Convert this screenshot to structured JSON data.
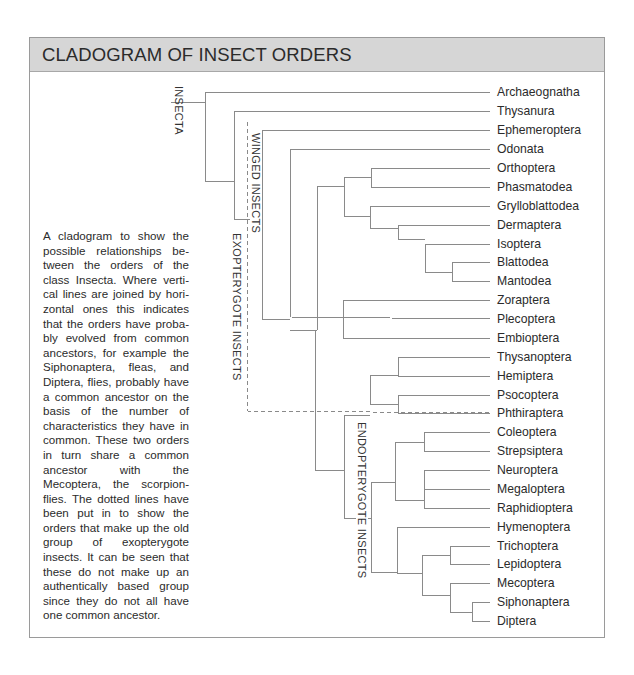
{
  "title": "CLADOGRAM OF INSECT ORDERS",
  "caption": "A cladogram to show the possible relationships be­tween the orders of the class Insecta. Where verti­cal lines are joined by hori­zontal ones this indicates that the orders have proba­bly evolved from common ancestors, for example the Siphonaptera, fleas, and Diptera, flies, probably have a common ancestor on the basis of the number of characteristics they have in common. These two orders in turn share a com­mon ancestor with the Mecoptera, the scorpion­flies. The dotted lines have been put in to show the orders that make up the old group of exopterygote insects. It can be seen that these do not make up an authentically based group since they do not all have one common ancestor.",
  "group_labels": {
    "insecta": "INSECTA",
    "winged": "WINGED INSECTS",
    "exopterygote": "EXOPTERYGOTE INSECTS",
    "endopterygote": "ENDOPTERYGOTE INSECTS"
  },
  "chart_data": {
    "type": "cladogram",
    "title": "CLADOGRAM OF INSECT ORDERS",
    "taxa": [
      "Archaeognatha",
      "Thysanura",
      "Ephemeroptera",
      "Odonata",
      "Orthoptera",
      "Phasmatodea",
      "Grylloblattodea",
      "Dermaptera",
      "Isoptera",
      "Blattodea",
      "Mantodea",
      "Zoraptera",
      "Plecoptera",
      "Embioptera",
      "Thysanoptera",
      "Hemiptera",
      "Psocoptera",
      "Phthiraptera",
      "Coleoptera",
      "Strepsiptera",
      "Neuroptera",
      "Megaloptera",
      "Raphidioptera",
      "Hymenoptera",
      "Trichoptera",
      "Lepidoptera",
      "Mecoptera",
      "Siphonaptera",
      "Diptera"
    ],
    "newick": "(Archaeognatha,(Thysanura,(Ephemeroptera,((Odonata,((Orthoptera,Phasmatodea),(Grylloblattodea,(Dermaptera,(Isoptera,(Blattodea,Mantodea))))),(Zoraptera,Plecoptera,Embioptera)),(((Thysanoptera,Hemiptera),(Psocoptera,Phthiraptera)),(((Coleoptera,Strepsiptera),(Neuroptera,Megaloptera,Raphidioptera)),(Hymenoptera,((Trichoptera,Lepidoptera),(Mecoptera,(Siphonaptera,Diptera))))))))))",
    "groups": [
      {
        "name": "INSECTA",
        "members": "all"
      },
      {
        "name": "WINGED INSECTS",
        "members_from": "Ephemeroptera",
        "members_to": "Diptera"
      },
      {
        "name": "EXOPTERYGOTE INSECTS",
        "style": "dotted",
        "members_from": "Ephemeroptera",
        "members_to": "Phthiraptera"
      },
      {
        "name": "ENDOPTERYGOTE INSECTS",
        "members_from": "Coleoptera",
        "members_to": "Diptera"
      }
    ],
    "row_y": [
      92,
      111,
      130,
      149,
      168,
      187,
      206,
      225,
      244,
      262,
      281,
      300,
      319,
      338,
      357,
      376,
      395,
      413,
      432,
      451,
      470,
      489,
      508,
      527,
      546,
      564,
      583,
      602,
      621
    ],
    "label_x": 497,
    "tip_x": 490,
    "segments": [
      [
        171,
        102,
        205,
        102
      ],
      [
        205,
        92,
        205,
        181
      ],
      [
        205,
        92,
        490,
        92
      ],
      [
        205,
        181,
        234,
        181
      ],
      [
        234,
        111,
        234,
        219
      ],
      [
        234,
        111,
        490,
        111
      ],
      [
        234,
        219,
        262,
        219
      ],
      [
        262,
        130,
        262,
        319
      ],
      [
        262,
        130,
        490,
        130
      ],
      [
        262,
        319,
        290,
        319
      ],
      [
        290,
        149,
        290,
        317
      ],
      [
        290,
        149,
        490,
        149
      ],
      [
        290,
        317,
        490,
        319
      ],
      [
        317,
        186,
        317,
        330
      ],
      [
        317,
        330,
        290,
        330
      ],
      [
        317,
        186,
        344,
        186
      ],
      [
        344,
        177,
        344,
        216
      ],
      [
        344,
        177,
        371,
        177
      ],
      [
        371,
        168,
        371,
        187
      ],
      [
        371,
        168,
        490,
        168
      ],
      [
        371,
        187,
        490,
        187
      ],
      [
        344,
        216,
        370,
        216
      ],
      [
        370,
        206,
        370,
        228
      ],
      [
        370,
        206,
        490,
        206
      ],
      [
        370,
        228,
        398,
        228
      ],
      [
        398,
        225,
        398,
        239
      ],
      [
        398,
        225,
        490,
        225
      ],
      [
        398,
        239,
        425,
        239
      ],
      [
        425,
        244,
        425,
        272
      ],
      [
        425,
        244,
        490,
        244
      ],
      [
        425,
        272,
        452,
        272
      ],
      [
        452,
        262,
        452,
        281
      ],
      [
        452,
        262,
        490,
        262
      ],
      [
        452,
        281,
        490,
        281
      ],
      [
        343,
        300,
        343,
        338
      ],
      [
        343,
        300,
        490,
        300
      ],
      [
        343,
        338,
        490,
        338
      ],
      [
        315,
        330,
        315,
        470
      ],
      [
        315,
        470,
        344,
        470
      ],
      [
        344,
        415,
        344,
        518
      ],
      [
        344,
        415,
        370,
        415
      ],
      [
        370,
        375,
        370,
        404
      ],
      [
        370,
        375,
        398,
        375
      ],
      [
        398,
        357,
        398,
        376
      ],
      [
        398,
        357,
        490,
        357
      ],
      [
        398,
        376,
        490,
        376
      ],
      [
        370,
        404,
        398,
        404
      ],
      [
        398,
        395,
        398,
        413
      ],
      [
        398,
        395,
        490,
        395
      ],
      [
        398,
        413,
        490,
        413
      ],
      [
        344,
        518,
        371,
        518
      ],
      [
        371,
        482,
        371,
        572
      ],
      [
        371,
        482,
        395,
        482
      ],
      [
        395,
        442,
        395,
        500
      ],
      [
        395,
        442,
        424,
        442
      ],
      [
        424,
        432,
        424,
        451
      ],
      [
        424,
        432,
        490,
        432
      ],
      [
        424,
        451,
        490,
        451
      ],
      [
        395,
        500,
        424,
        500
      ],
      [
        424,
        470,
        424,
        508
      ],
      [
        424,
        470,
        490,
        470
      ],
      [
        424,
        489,
        490,
        489
      ],
      [
        424,
        508,
        490,
        508
      ],
      [
        371,
        572,
        397,
        572
      ],
      [
        397,
        527,
        397,
        573
      ],
      [
        397,
        527,
        490,
        527
      ],
      [
        397,
        573,
        422,
        573
      ],
      [
        422,
        555,
        422,
        595
      ],
      [
        422,
        555,
        450,
        555
      ],
      [
        450,
        546,
        450,
        564
      ],
      [
        450,
        546,
        490,
        546
      ],
      [
        450,
        564,
        490,
        564
      ],
      [
        422,
        595,
        450,
        595
      ],
      [
        450,
        583,
        450,
        612
      ],
      [
        450,
        583,
        490,
        583
      ],
      [
        450,
        612,
        472,
        612
      ],
      [
        472,
        602,
        472,
        621
      ],
      [
        472,
        602,
        490,
        602
      ],
      [
        472,
        621,
        490,
        621
      ]
    ],
    "dotted_segments": [
      [
        247,
        122,
        247,
        411
      ],
      [
        247,
        411,
        490,
        413
      ]
    ],
    "line_color": "#8a8a8a",
    "header_color": "#d6d6d6"
  }
}
